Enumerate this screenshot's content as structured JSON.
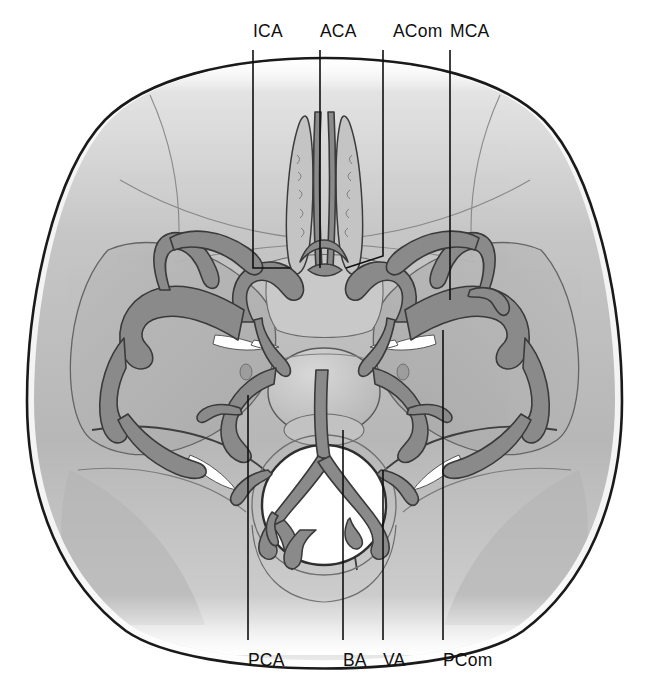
{
  "figure": {
    "view": "axial inferior view of cranial base with cerebral arterial circle",
    "background_color": "#ffffff",
    "ink_color": "#101010",
    "vessel_fill": "#8a8a8a",
    "vessel_outline": "#3d3d3d",
    "brain_tissue_color": "#b9b9b9",
    "bone_color": "#f2f2f2",
    "diploe_speckle_color": "#9a9a9a",
    "foramen_white": "#ffffff"
  },
  "labels": {
    "top": [
      {
        "text": "ICA",
        "name": "internal-carotid-artery",
        "x": 253,
        "leader_x": 253,
        "leader_y1": 50,
        "leader_y2": 268,
        "leader_x2": 290,
        "leader_y3": 268
      },
      {
        "text": "ACA",
        "name": "anterior-cerebral-artery",
        "x": 320,
        "leader_x": 320,
        "leader_y1": 50,
        "leader_y2": 268,
        "leader_x2": 320,
        "leader_y3": 268
      },
      {
        "text": "ACom",
        "name": "anterior-communicating-artery",
        "x": 393,
        "leader_x": 383,
        "leader_y1": 50,
        "leader_y2": 256,
        "leader_x2": 346,
        "leader_y3": 268
      },
      {
        "text": "MCA",
        "name": "middle-cerebral-artery",
        "x": 450,
        "leader_x": 450,
        "leader_y1": 50,
        "leader_y2": 300,
        "leader_x2": 450,
        "leader_y3": 300
      }
    ],
    "bottom": [
      {
        "text": "PCA",
        "name": "posterior-cerebral-artery",
        "x": 248,
        "leader_x": 248,
        "leader_y1": 395,
        "leader_y2": 640
      },
      {
        "text": "BA",
        "name": "basilar-artery",
        "x": 343,
        "leader_x": 343,
        "leader_y1": 430,
        "leader_y2": 640
      },
      {
        "text": "VA",
        "name": "vertebral-artery",
        "x": 383,
        "leader_x": 383,
        "leader_y1": 470,
        "leader_y2": 640
      },
      {
        "text": "PCom",
        "name": "posterior-communicating-artery",
        "x": 443,
        "leader_x": 443,
        "leader_y1": 330,
        "leader_y2": 640
      }
    ]
  }
}
